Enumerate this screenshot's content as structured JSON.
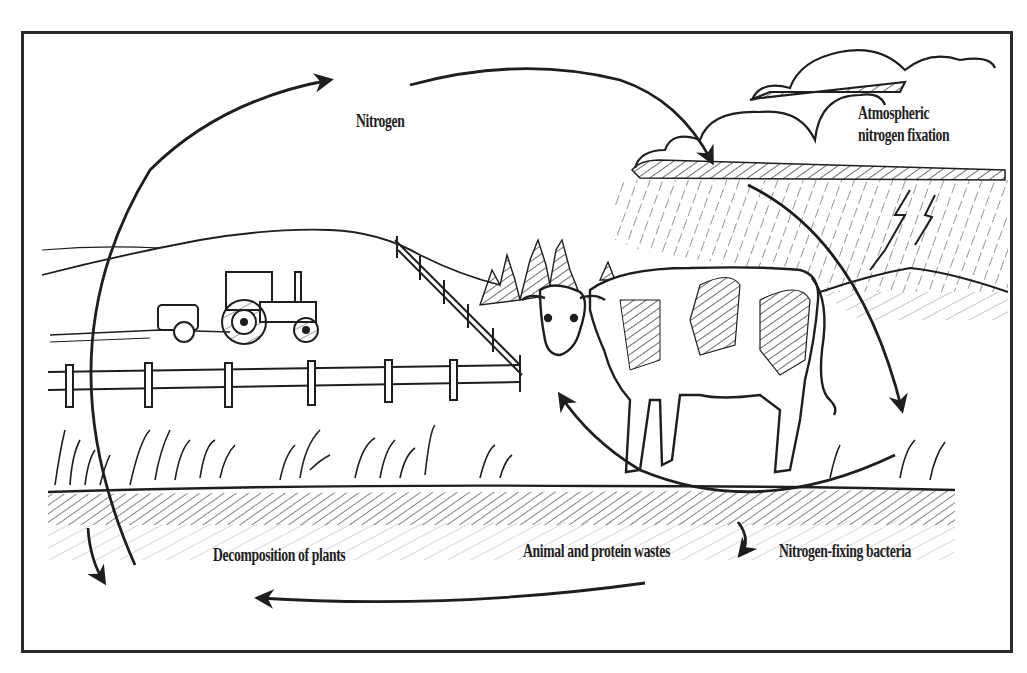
{
  "diagram": {
    "labels": {
      "nitrogen": "Nitrogen",
      "atmospheric_line1": "Atmospheric",
      "atmospheric_line2": "nitrogen fixation",
      "decomposition": "Decomposition of plants",
      "animal_wastes": "Animal and protein wastes",
      "bacteria": "Nitrogen-fixing bacteria"
    },
    "colors": {
      "ink": "#1e1e1e",
      "frame": "#2a2a2a",
      "background": "#ffffff"
    },
    "elements": [
      "clouds",
      "rain",
      "lightning",
      "hill",
      "tractor",
      "fence",
      "trees",
      "cow",
      "grass",
      "soil",
      "cycle-arrows"
    ]
  }
}
